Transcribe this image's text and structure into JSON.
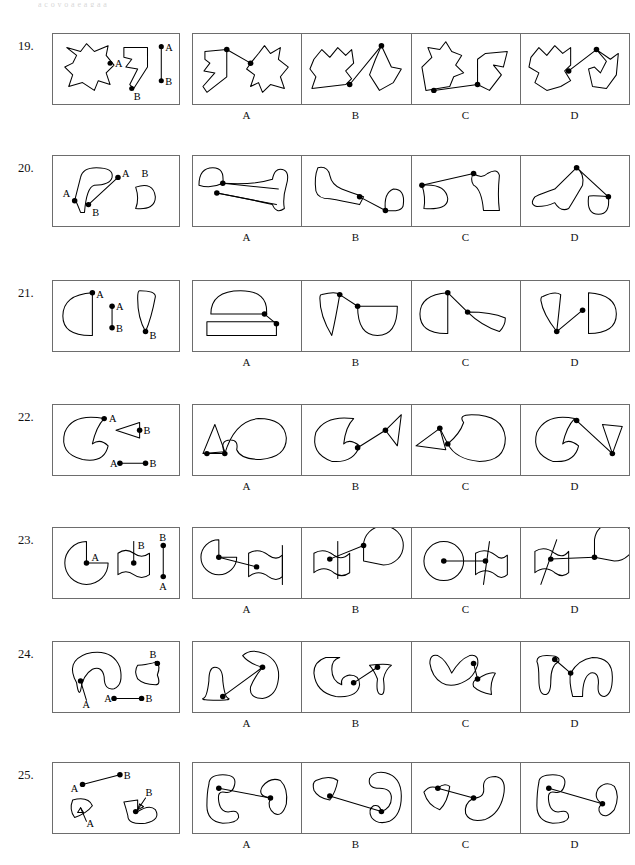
{
  "page": {
    "cut_header_text": "a c o y   o   a e   a g a   a",
    "option_labels": [
      "A",
      "B",
      "C",
      "D"
    ],
    "point_labels": [
      "A",
      "B"
    ],
    "ink_color": "#000000",
    "panel_border_color": "#6d6d6d",
    "background_color": "#ffffff"
  },
  "questions": [
    {
      "number": "19.",
      "prompt": {
        "point_labels": [
          "A",
          "B",
          "A",
          "B"
        ],
        "description": "star-like blob with point A on its right edge; hooked arrow-shaped figure with point B at its lower tip; separate vertical segment with A at top and B at bottom"
      },
      "options": [
        {
          "label": "A",
          "description": "hooked arrow shape at left with dot at top, line to dot on star blob at right"
        },
        {
          "label": "B",
          "description": "star blob at left with dot at lower right, line up to dot at top of angular hooked shape"
        },
        {
          "label": "C",
          "description": "star blob at left with dot at bottom, line right to dot at bottom of hooked shape"
        },
        {
          "label": "D",
          "description": "star blob with dot at right, line to dot at top of notched shape"
        }
      ]
    },
    {
      "number": "20.",
      "prompt": {
        "point_labels": [
          "A",
          "B",
          "A",
          "B"
        ],
        "description": "long flared club shape with A at left lower tip; segment with A at upper right and B at lower left; small half-dome shape labelled B"
      },
      "options": [
        {
          "label": "A",
          "description": "small dome at upper left with dot, two lines to flared club shape at right with dot"
        },
        {
          "label": "B",
          "description": "flared club at left, line down-right to dot on small dome at right"
        },
        {
          "label": "C",
          "description": "dome at left with dot, long line up-right to dot at top of flared shape"
        },
        {
          "label": "D",
          "description": "tilted flared club with dot at top, lines to dot on dome at lower right"
        }
      ]
    },
    {
      "number": "21.",
      "prompt": {
        "point_labels": [
          "A",
          "A",
          "B",
          "B"
        ],
        "description": "D-shaped arc with A at its top right; short vertical segment with A above B; tall narrow wedge with B at its bottom tip"
      },
      "options": [
        {
          "label": "A",
          "description": "dome shape above a flat rectangle, dots joining them at the right"
        },
        {
          "label": "B",
          "description": "narrow wedge at left with dot at top, line to dot on bowl shape at right"
        },
        {
          "label": "C",
          "description": "D-shape at left with dot at top, line down-right to dot on wedge"
        },
        {
          "label": "D",
          "description": "narrow wedge pointing down with dot at tip, line to dot on D-shape at right"
        }
      ]
    },
    {
      "number": "22.",
      "prompt": {
        "point_labels": [
          "A",
          "B",
          "A",
          "B"
        ],
        "description": "large C-shaped blob with A at its notch; small triangle with B at its right vertex; separate horizontal segment A to B"
      },
      "options": [
        {
          "label": "A",
          "description": "triangle at left with dot at its right vertex, short line to dot in the notch of the C-blob"
        },
        {
          "label": "B",
          "description": "C-blob at left with dot in notch, line up-right to dot on triangle"
        },
        {
          "label": "C",
          "description": "triangle at left with dot, short line to dot on the C-blob notch at right"
        },
        {
          "label": "D",
          "description": "C-blob with dot at top notch, long line down-right to dot on small triangle"
        }
      ]
    },
    {
      "number": "23.",
      "prompt": {
        "point_labels": [
          "A",
          "B",
          "B",
          "A"
        ],
        "description": "pac-man disc with A at its centre; wavy flag shape with B on its staff; vertical segment with B at top and A at bottom"
      },
      "options": [
        {
          "label": "A",
          "description": "pac-man disc at left with centre dot, line to dot on wavy flag at right"
        },
        {
          "label": "B",
          "description": "wavy flag at left with dot, line up-right to dot at edge of pac-man disc"
        },
        {
          "label": "C",
          "description": "full disc with centre dot, horizontal line to dot on wavy flag at right"
        },
        {
          "label": "D",
          "description": "wavy flag at left with dot, line right to dot at centre of pac-man disc"
        }
      ]
    },
    {
      "number": "24.",
      "prompt": {
        "point_labels": [
          "B",
          "A",
          "A",
          "B"
        ],
        "description": "large curved hook blob with A on a stem at lower left; small flared vase shape with B at its right; separate horizontal segment A to B"
      },
      "options": [
        {
          "label": "A",
          "description": "small vase at lower left with dot, long line up-right to dot on curved hook blob"
        },
        {
          "label": "B",
          "description": "curved hook blob at left with dot, line up-right to dot on vase shape"
        },
        {
          "label": "C",
          "description": "curved hook blob with dot at top right, short line down to dot on flared shape"
        },
        {
          "label": "D",
          "description": "vase at left with dot at top, line to dot on large curved hook blob at right"
        }
      ]
    },
    {
      "number": "25.",
      "prompt": {
        "point_labels": [
          "A",
          "B",
          "B",
          "A"
        ],
        "description": "segment with A at lower left and B at upper right; small fan shape with arrow to A; hooked bracket shape with arrow to B"
      },
      "options": [
        {
          "label": "A",
          "description": "hooked bracket at left with dot, long line right to dot on fan shape"
        },
        {
          "label": "B",
          "description": "fan shape at left with dot, long line down-right to dot on hooked bracket"
        },
        {
          "label": "C",
          "description": "fan shape at left with dot, line right to dot on hooked bracket"
        },
        {
          "label": "D",
          "description": "hooked bracket at left with dot, long line down-right to dot on fan shape"
        }
      ]
    }
  ]
}
